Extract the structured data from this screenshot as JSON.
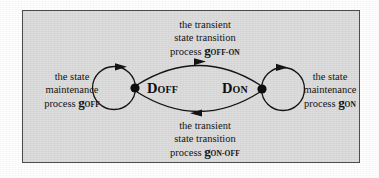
{
  "figure": {
    "type": "state-transition-diagram",
    "background_color": "#dcdcdc",
    "border_color": "#4a4a4a",
    "ink_color": "#101010"
  },
  "states": [
    {
      "id": "d-off",
      "symbol": "D",
      "subscript": "OFF",
      "node_x": 135,
      "node_y": 88
    },
    {
      "id": "d-on",
      "symbol": "D",
      "subscript": "ON",
      "node_x": 262,
      "node_y": 89
    }
  ],
  "labels": {
    "top": {
      "line1": "the transient",
      "line2": "state transition",
      "process_word": "process",
      "process_symbol": "g",
      "process_subscript": "OFF-ON"
    },
    "bottom": {
      "line1": "the transient",
      "line2": "state transition",
      "process_word": "process",
      "process_symbol": "g",
      "process_subscript": "ON-OFF"
    },
    "left": {
      "line1": "the state",
      "line2": "maintenance",
      "process_word": "process",
      "process_symbol": "g",
      "process_subscript": "OFF"
    },
    "right": {
      "line1": "the state",
      "line2": "maintenance",
      "process_word": "process",
      "process_symbol": "g",
      "process_subscript": "ON"
    }
  },
  "edges": [
    {
      "id": "transition-off-to-on",
      "kind": "arc",
      "direction": "right",
      "from": "d-off",
      "to": "d-on",
      "position": "top"
    },
    {
      "id": "transition-on-to-off",
      "kind": "arc",
      "direction": "left",
      "from": "d-on",
      "to": "d-off",
      "position": "bottom"
    },
    {
      "id": "self-loop-off",
      "kind": "self-loop",
      "direction": "clockwise",
      "from": "d-off",
      "to": "d-off",
      "position": "left"
    },
    {
      "id": "self-loop-on",
      "kind": "self-loop",
      "direction": "clockwise",
      "from": "d-on",
      "to": "d-on",
      "position": "right"
    }
  ]
}
